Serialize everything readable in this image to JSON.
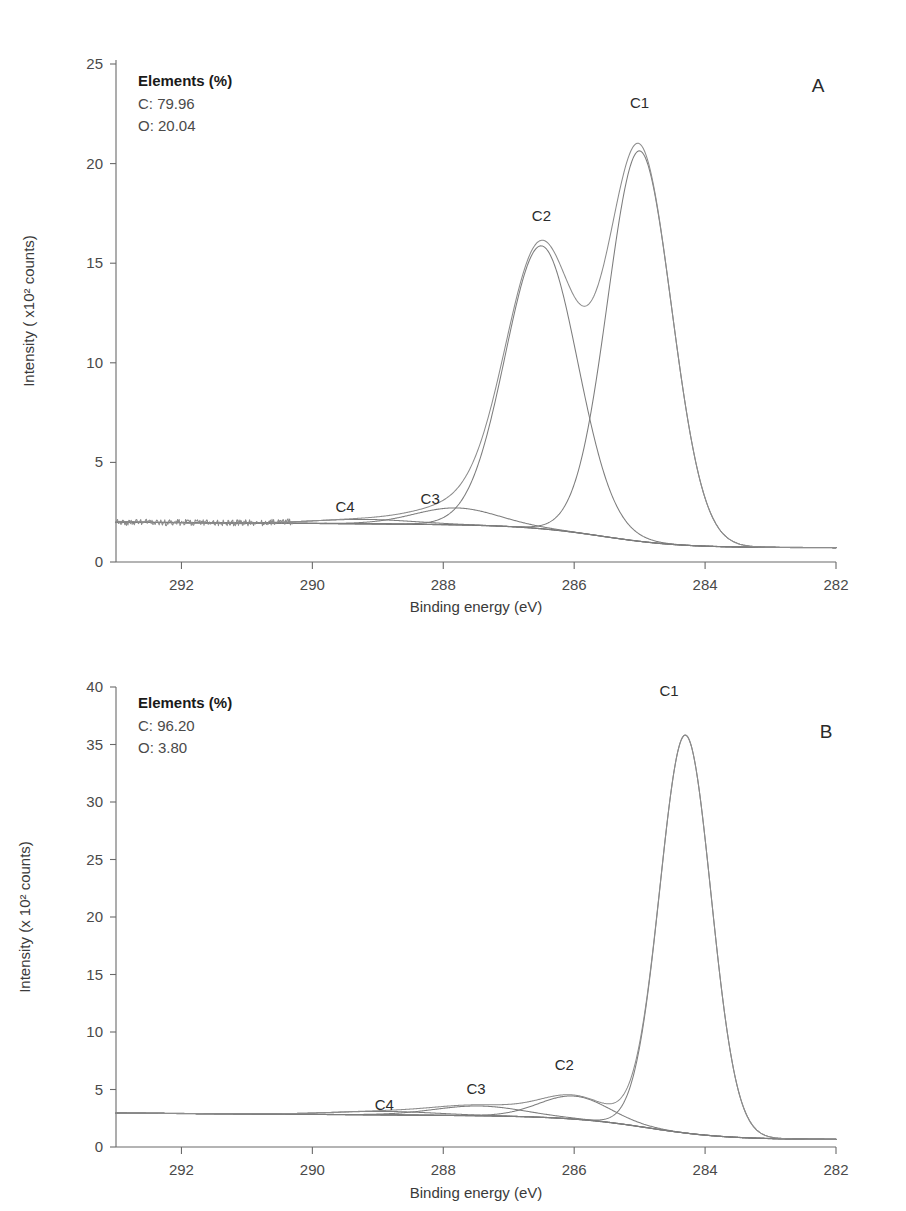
{
  "figure": {
    "panels": [
      {
        "id": "A",
        "letter": "A",
        "legend": {
          "heading": "Elements (%)",
          "lines": [
            "C: 79.96",
            "O: 20.04"
          ]
        }
      },
      {
        "id": "B",
        "letter": "B",
        "legend": {
          "heading": "Elements (%)",
          "lines": [
            "C: 96.20",
            "O: 3.80"
          ]
        }
      }
    ]
  },
  "chart_data": [
    {
      "type": "line",
      "panel": "A",
      "title": "",
      "xlabel": "Binding energy (eV)",
      "ylabel": "Intensity ( x10² counts)",
      "xlim": [
        293,
        282
      ],
      "ylim": [
        0,
        25
      ],
      "xticks": [
        292,
        290,
        288,
        286,
        284,
        282
      ],
      "yticks": [
        0,
        5,
        10,
        15,
        20,
        25
      ],
      "xtick_labels": [
        "292",
        "290",
        "288",
        "286",
        "284",
        "282"
      ],
      "ytick_labels": [
        "0",
        "5",
        "10",
        "15",
        "20",
        "25"
      ],
      "x_axis_reversed": true,
      "grid": false,
      "legend_position": "top-left",
      "annotations": [
        {
          "text": "C1",
          "x": 285.0,
          "y": 22.8
        },
        {
          "text": "C2",
          "x": 286.5,
          "y": 17.1
        },
        {
          "text": "C3",
          "x": 288.2,
          "y": 2.9
        },
        {
          "text": "C4",
          "x": 289.5,
          "y": 2.5
        },
        {
          "text": "A",
          "x": 282.45,
          "y": 23.6
        }
      ],
      "components": [
        {
          "name": "C1",
          "center": 285.0,
          "height": 19.6,
          "fwhm": 1.15,
          "shape": "gaussian"
        },
        {
          "name": "C2",
          "center": 286.5,
          "height": 14.2,
          "fwhm": 1.3,
          "shape": "gaussian"
        },
        {
          "name": "C3",
          "center": 287.8,
          "height": 0.85,
          "fwhm": 1.5,
          "shape": "gaussian"
        },
        {
          "name": "C4",
          "center": 289.2,
          "height": 0.22,
          "fwhm": 1.8,
          "shape": "gaussian"
        }
      ],
      "background": {
        "left_value": 2.0,
        "right_value": 0.72,
        "type": "shirley-like"
      },
      "envelope": {
        "peaks": [
          {
            "label": "C1",
            "x": 285.0,
            "y": 21.8
          },
          {
            "label": "C2",
            "x": 286.5,
            "y": 16.3
          },
          {
            "label": "valley",
            "x": 285.75,
            "y": 13.1
          },
          {
            "label": "C3",
            "x": 287.8,
            "y": 2.25
          }
        ]
      },
      "noise": {
        "present": true,
        "region": [
          293,
          290.3
        ],
        "amplitude": 0.16,
        "level": 2.0
      }
    },
    {
      "type": "line",
      "panel": "B",
      "title": "",
      "xlabel": "Binding energy (eV)",
      "ylabel": "Intensity (x 10² counts)",
      "xlim": [
        293,
        282
      ],
      "ylim": [
        0,
        40
      ],
      "xticks": [
        292,
        290,
        288,
        286,
        284,
        282
      ],
      "yticks": [
        0,
        5,
        10,
        15,
        20,
        25,
        30,
        35,
        40
      ],
      "xtick_labels": [
        "292",
        "290",
        "288",
        "286",
        "284",
        "282"
      ],
      "ytick_labels": [
        "0",
        "5",
        "10",
        "15",
        "20",
        "25",
        "30",
        "35",
        "40"
      ],
      "x_axis_reversed": true,
      "grid": false,
      "legend_position": "top-left",
      "annotations": [
        {
          "text": "C1",
          "x": 284.55,
          "y": 39.2
        },
        {
          "text": "C2",
          "x": 286.15,
          "y": 6.7
        },
        {
          "text": "C3",
          "x": 287.5,
          "y": 4.6
        },
        {
          "text": "C4",
          "x": 288.9,
          "y": 3.2
        },
        {
          "text": "B",
          "x": 282.4,
          "y": 35.6
        }
      ],
      "components": [
        {
          "name": "C1",
          "center": 284.3,
          "height": 34.6,
          "fwhm": 0.92,
          "shape": "gaussian"
        },
        {
          "name": "C2",
          "center": 286.0,
          "height": 2.0,
          "fwhm": 1.25,
          "shape": "gaussian"
        },
        {
          "name": "C3",
          "center": 287.45,
          "height": 0.85,
          "fwhm": 1.6,
          "shape": "gaussian"
        },
        {
          "name": "C4",
          "center": 288.9,
          "height": 0.3,
          "fwhm": 1.9,
          "shape": "gaussian"
        }
      ],
      "background": {
        "left_value": 2.95,
        "right_value": 0.65,
        "type": "shirley-like"
      },
      "envelope": {
        "peaks": [
          {
            "label": "C1",
            "x": 284.3,
            "y": 37.5
          },
          {
            "label": "C2",
            "x": 286.0,
            "y": 5.0
          },
          {
            "label": "C3",
            "x": 287.45,
            "y": 3.5
          }
        ]
      },
      "noise": {
        "present": false,
        "region": [
          293,
          291
        ],
        "amplitude": 0.05,
        "level": 2.95
      }
    }
  ]
}
